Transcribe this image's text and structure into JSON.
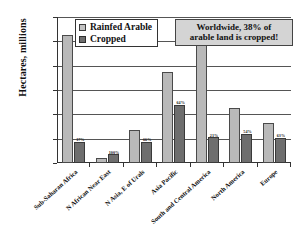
{
  "chart_data": {
    "type": "bar",
    "title": "",
    "xlabel": "",
    "ylabel": "Hectares, millions",
    "ylim": [
      0,
      1200
    ],
    "ytick_labels": [
      "1200",
      "1000",
      "800",
      "600",
      "400",
      "200",
      "0"
    ],
    "ytick_values": [
      1200,
      1000,
      800,
      600,
      400,
      200,
      0
    ],
    "grid": true,
    "legend_position": "top-left-inside",
    "categories": [
      "Sub-Saharan Africa",
      "N African Near East",
      "N Asia, E of Urals",
      "Asia Pacific",
      "South and Central America",
      "North America",
      "Europe"
    ],
    "series": [
      {
        "name": "Rainfed Arable",
        "color": "#b9b9b9",
        "values": [
          1050,
          45,
          270,
          750,
          1000,
          450,
          330
        ]
      },
      {
        "name": "Cropped",
        "color": "#6e6e6e",
        "values": [
          175,
          70,
          175,
          480,
          210,
          240,
          205
        ]
      }
    ],
    "point_labels": [
      "17%",
      "100%",
      "66%",
      "64%",
      "21%",
      "54%",
      "63%"
    ],
    "annotations": [
      "Worldwide, 38% of arable land is cropped!"
    ]
  },
  "legend": {
    "items": [
      {
        "label": "Rainfed Arable",
        "swatch": "light-gray-swatch"
      },
      {
        "label": "Cropped",
        "swatch": "dark-gray-swatch"
      }
    ]
  },
  "annotation": {
    "line1": "Worldwide, 38% of",
    "line2": "arable land is cropped!"
  },
  "axis": {
    "y_title": "Hectares, millions"
  }
}
